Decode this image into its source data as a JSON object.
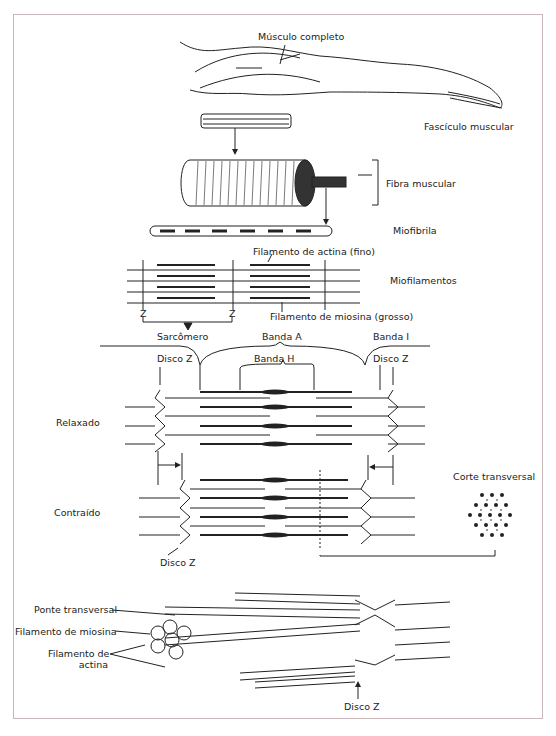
{
  "diagram": {
    "hierarchy": {
      "whole_muscle": "Músculo completo",
      "fascicle": "Fascículo muscular",
      "fiber": "Fibra muscular",
      "myofibril": "Miofibrila",
      "myofilaments": "Miofilamentos",
      "actin_thin": "Filamento de actina (fino)",
      "myosin_thick": "Filamento de miosina (grosso)"
    },
    "sarcomere": {
      "z_left": "Z",
      "z_right": "Z",
      "sarcomere": "Sarcômero",
      "band_a": "Banda A",
      "band_i": "Banda I",
      "band_h": "Banda H",
      "disc_z_left": "Disco Z",
      "disc_z_right": "Disco Z",
      "relaxed": "Relaxado",
      "contracted": "Contraído",
      "disc_z_bottom": "Disco Z",
      "cross_section": "Corte transversal"
    },
    "detail": {
      "cross_bridge": "Ponte transversal",
      "myosin_filament": "Filamento de miosina",
      "actin_filament_line1": "Filamento de",
      "actin_filament_line2": "actina",
      "disc_z": "Disco Z"
    }
  }
}
